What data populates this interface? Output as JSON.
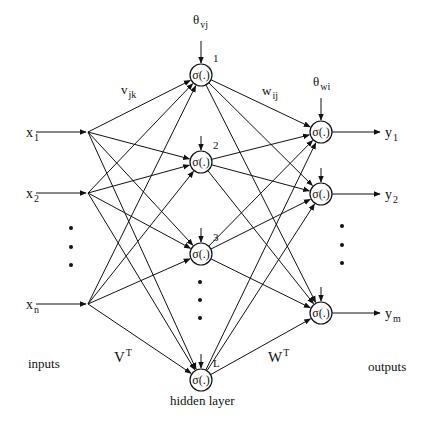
{
  "diagram": {
    "type": "neural-network",
    "background": "#ffffff",
    "stroke_color": "#111111",
    "activation_label": "σ(.)",
    "inputs": {
      "section_label": "inputs",
      "items": [
        {
          "id": "x1",
          "base": "x",
          "sub": "1",
          "y": 132
        },
        {
          "id": "x2",
          "base": "x",
          "sub": "2",
          "y": 193
        },
        {
          "id": "xn",
          "base": "x",
          "sub": "n",
          "y": 304
        }
      ],
      "ellipsis_dots_y": [
        228,
        247,
        265
      ],
      "junction_x": 88
    },
    "hidden": {
      "section_label": "hidden layer",
      "bias_label": {
        "base": "θ",
        "sub": "vj"
      },
      "weight_label": {
        "base": "v",
        "sub": "jk"
      },
      "matrix_label": {
        "base": "V",
        "sup": "T"
      },
      "x": 201,
      "nodes": [
        {
          "id": "h1",
          "index_label": "1",
          "y": 75
        },
        {
          "id": "h2",
          "index_label": "2",
          "y": 162
        },
        {
          "id": "h3",
          "index_label": "3",
          "y": 254
        },
        {
          "id": "hL",
          "index_label": "L",
          "y": 380
        }
      ],
      "ellipsis_dots_y": [
        282,
        300,
        318
      ]
    },
    "outputs": {
      "section_label": "outputs",
      "bias_label": {
        "base": "θ",
        "sub": "wi"
      },
      "weight_label": {
        "base": "w",
        "sub": "ij"
      },
      "matrix_label": {
        "base": "W",
        "sup": "T"
      },
      "x": 321,
      "nodes": [
        {
          "id": "y1",
          "base": "y",
          "sub": "1",
          "y": 132
        },
        {
          "id": "y2",
          "base": "y",
          "sub": "2",
          "y": 194
        },
        {
          "id": "ym",
          "base": "y",
          "sub": "m",
          "y": 313
        }
      ],
      "ellipsis_dots_y": [
        226,
        245,
        263
      ]
    }
  }
}
